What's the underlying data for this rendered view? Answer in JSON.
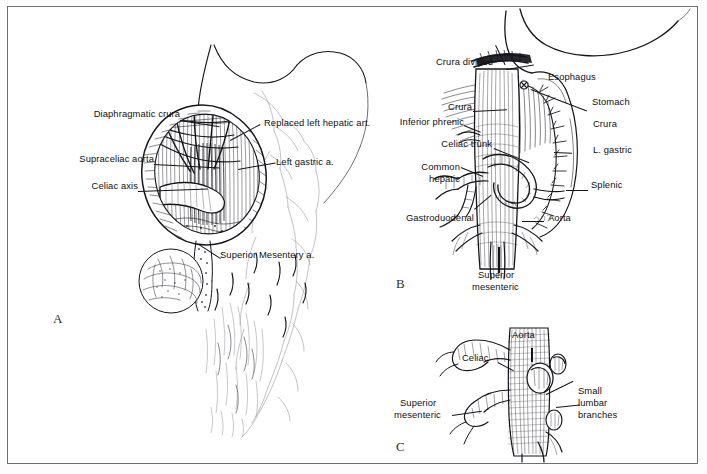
{
  "figure": {
    "background_color": "#ffffff",
    "frame_color": "#6f6f72",
    "ink_color": "#15151b",
    "panel_letters": [
      "A",
      "B",
      "C"
    ]
  },
  "panel_a": {
    "letter": "A",
    "caption": "Exposure of supraceliac aorta through divided diaphragmatic crura",
    "labels": [
      {
        "text": "Diaphragmatic crura",
        "x": 78,
        "y": 107
      },
      {
        "text": "Supraceliac aorta",
        "x": 55,
        "y": 152
      },
      {
        "text": "Celiac axis",
        "x": 78,
        "y": 179
      },
      {
        "text": "Replaced left hepatic art.",
        "x": 256,
        "y": 117
      },
      {
        "text": "Left gastric a.",
        "x": 268,
        "y": 155
      },
      {
        "text": "Superior Mesentery a.",
        "x": 212,
        "y": 249
      }
    ]
  },
  "panel_b": {
    "letter": "B",
    "caption": "Celiac axis branches after division of crura",
    "labels": [
      {
        "text": "Crura divided",
        "x": 428,
        "y": 55
      },
      {
        "text": "Esophagus",
        "x": 540,
        "y": 70
      },
      {
        "text": "Stomach",
        "x": 584,
        "y": 95
      },
      {
        "text": "Crura",
        "x": 445,
        "y": 100
      },
      {
        "text": "Crura",
        "x": 585,
        "y": 117
      },
      {
        "text": "Inferior phrenic",
        "x": 396,
        "y": 115
      },
      {
        "text": "L. gastric",
        "x": 585,
        "y": 143
      },
      {
        "text": "Celiac trunk",
        "x": 417,
        "y": 137
      },
      {
        "text": "Common",
        "x": 414,
        "y": 160
      },
      {
        "text": "hepatic",
        "x": 420,
        "y": 172
      },
      {
        "text": "Splenic",
        "x": 583,
        "y": 178
      },
      {
        "text": "Gastroduodenal",
        "x": 389,
        "y": 211
      },
      {
        "text": "Aorta",
        "x": 540,
        "y": 211
      },
      {
        "text": "Superior",
        "x": 483,
        "y": 268
      },
      {
        "text": "mesenteric",
        "x": 477,
        "y": 280
      }
    ]
  },
  "panel_c": {
    "letter": "C",
    "caption": "Posterior aortic branches including small lumbar branches",
    "labels": [
      {
        "text": "Aorta",
        "x": 512,
        "y": 328
      },
      {
        "text": "Celiac",
        "x": 462,
        "y": 351
      },
      {
        "text": "Superior",
        "x": 435,
        "y": 396
      },
      {
        "text": "mesenteric",
        "x": 429,
        "y": 408
      },
      {
        "text": "Small",
        "x": 573,
        "y": 384
      },
      {
        "text": "lumbar",
        "x": 573,
        "y": 396
      },
      {
        "text": "branches",
        "x": 573,
        "y": 408
      }
    ]
  }
}
